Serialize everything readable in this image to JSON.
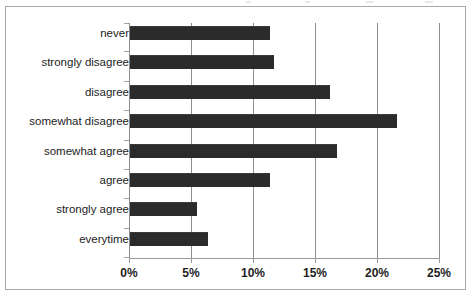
{
  "chart_data": {
    "type": "bar",
    "orientation": "horizontal",
    "title": "",
    "subtitle": "",
    "xlabel": "",
    "ylabel": "",
    "xlim": [
      0,
      25
    ],
    "xtick_labels": [
      "0%",
      "5%",
      "10%",
      "15%",
      "20%",
      "25%"
    ],
    "xtick_values": [
      0,
      5,
      10,
      15,
      20,
      25
    ],
    "grid": "vertical",
    "legend": "none",
    "units": "percent",
    "categories": [
      "never",
      "strongly disagree",
      "disagree",
      "somewhat disagree",
      "somewhat agree",
      "agree",
      "strongly agree",
      "everytime"
    ],
    "values": [
      11.3,
      11.6,
      16.1,
      21.5,
      16.7,
      11.3,
      5.4,
      6.3
    ],
    "series": [
      {
        "name": "",
        "values": [
          11.3,
          11.6,
          16.1,
          21.5,
          16.7,
          11.3,
          5.4,
          6.3
        ]
      }
    ]
  },
  "style": {
    "bar_color": "#2b2b2b",
    "gridline_color": "#8f8f8f",
    "axis_color": "#9a9a9a",
    "border_color": "#a9a9a9",
    "background_color": "#ffffff",
    "text_color": "#1d1d1d"
  }
}
